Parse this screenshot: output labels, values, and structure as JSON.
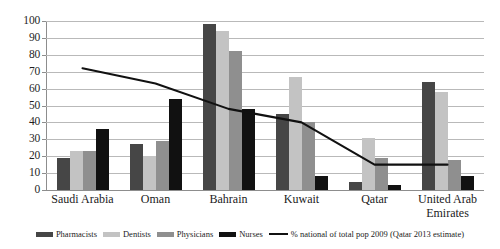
{
  "chart_data": {
    "type": "bar",
    "title": "",
    "subtitle": "",
    "xlabel": "",
    "ylabel": "",
    "ylim": [
      0,
      100
    ],
    "ytick_step": 10,
    "yticks": [
      "100",
      "90",
      "80",
      "70",
      "60",
      "50",
      "40",
      "30",
      "20",
      "10",
      "0"
    ],
    "grid": true,
    "legend_position": "bottom",
    "categories": [
      "Saudi Arabia",
      "Oman",
      "Bahrain",
      "Kuwait",
      "Qatar",
      "United Arab Emirates"
    ],
    "series": [
      {
        "name": "Pharmacists",
        "type": "bar",
        "color": "#464646",
        "values": [
          19,
          27,
          98,
          45,
          5,
          64
        ]
      },
      {
        "name": "Dentists",
        "type": "bar",
        "color": "#c3c3c3",
        "values": [
          23,
          20,
          94,
          67,
          31,
          58
        ]
      },
      {
        "name": "Physicians",
        "type": "bar",
        "color": "#8f8f8f",
        "values": [
          23,
          29,
          82,
          40,
          19,
          18
        ]
      },
      {
        "name": "Nurses",
        "type": "bar",
        "color": "#111111",
        "values": [
          36,
          54,
          48,
          8,
          3,
          8
        ]
      },
      {
        "name": "% national of total pop 2009 (Qatar 2013 estimate)",
        "type": "line",
        "color": "#111111",
        "values": [
          72,
          63,
          48,
          40,
          15,
          15
        ]
      }
    ]
  },
  "legend": {
    "items": [
      {
        "label": "Pharmacists",
        "swatch": "bar-swatch-pharmacists"
      },
      {
        "label": "Dentists",
        "swatch": "bar-swatch-dentists"
      },
      {
        "label": "Physicians",
        "swatch": "bar-swatch-physicians"
      },
      {
        "label": "Nurses",
        "swatch": "bar-swatch-nurses"
      },
      {
        "label": "% national of total pop 2009 (Qatar 2013 estimate)",
        "swatch": "line-swatch-percent-national"
      }
    ]
  }
}
